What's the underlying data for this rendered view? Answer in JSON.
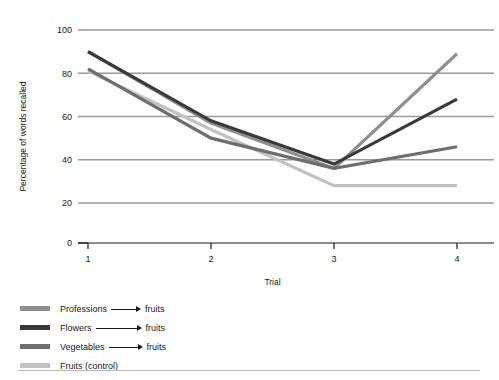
{
  "chart_data": {
    "type": "line",
    "title": "",
    "xlabel": "Trial",
    "ylabel": "Percentage of words recalled",
    "x": [
      1,
      2,
      3,
      4
    ],
    "xtick_labels": [
      "1",
      "2",
      "3",
      "4"
    ],
    "ytick_labels": [
      "0",
      "20",
      "40",
      "60",
      "80",
      "100"
    ],
    "yticks": [
      0,
      20,
      40,
      60,
      80,
      100
    ],
    "ylim": [
      0,
      100
    ],
    "xlim": [
      0.6,
      4.3
    ],
    "grid": "horizontal",
    "legend_position": "below-left",
    "series": [
      {
        "name": "Professions → fruits",
        "from": "Professions",
        "to": "fruits",
        "arrow": true,
        "color": "#8f8f8f",
        "values": [
          90,
          57,
          36,
          89
        ]
      },
      {
        "name": "Flowers → fruits",
        "from": "Flowers",
        "to": "fruits",
        "arrow": true,
        "color": "#3a3a3a",
        "values": [
          90,
          58,
          38,
          68
        ]
      },
      {
        "name": "Vegetables → fruits",
        "from": "Vegetables",
        "to": "fruits",
        "arrow": true,
        "color": "#6e6e6e",
        "values": [
          82,
          50,
          36,
          46
        ]
      },
      {
        "name": "Fruits (control)",
        "from": "Fruits (control)",
        "to": "",
        "arrow": false,
        "color": "#c2c2c2",
        "values": [
          81,
          54,
          28,
          28
        ]
      }
    ]
  },
  "axes": {
    "y_title": "Percentage of words recalled",
    "x_title": "Trial"
  },
  "legend": {
    "items": [
      {
        "label_from": "Professions",
        "label_to": "fruits",
        "arrow": true,
        "color": "#8f8f8f"
      },
      {
        "label_from": "Flowers",
        "label_to": "fruits",
        "arrow": true,
        "color": "#3a3a3a"
      },
      {
        "label_from": "Vegetables",
        "label_to": "fruits",
        "arrow": true,
        "color": "#6e6e6e"
      },
      {
        "label_from": "Fruits (control)",
        "label_to": "",
        "arrow": false,
        "color": "#c2c2c2"
      }
    ]
  },
  "style": {
    "grid_color": "#9a9a9a",
    "axis_color": "#1a1a1a",
    "background": "#ffffff",
    "footer_rule_color": "#b9b9b9"
  }
}
